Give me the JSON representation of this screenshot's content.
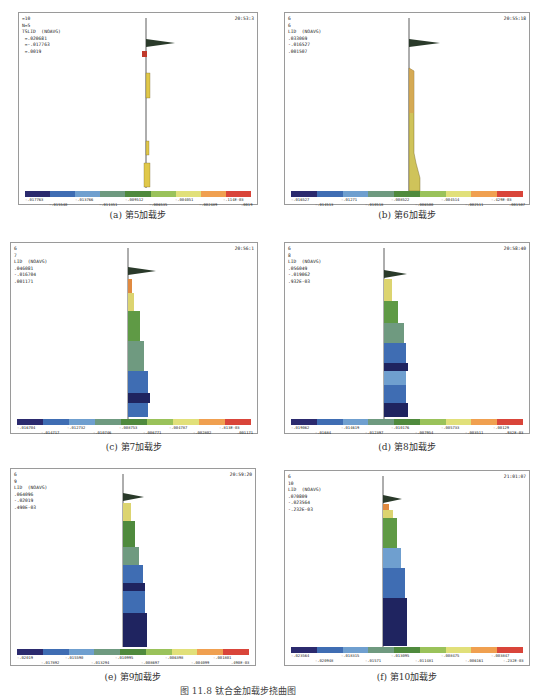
{
  "figure_caption": "图 11.8 钛合金加载步挠曲图",
  "legend_colors": [
    "#2b2a6e",
    "#3f6db3",
    "#6f9fcf",
    "#6f9a80",
    "#4f8a3d",
    "#9ac25a",
    "#e1e07a",
    "#f0a050",
    "#d9453a"
  ],
  "panels": [
    {
      "id": "a",
      "caption": "(a) 第5加载步",
      "info": [
        "=10",
        "N=5",
        "TSLID  (NOAVG)",
        " =.020681",
        " =-.017763",
        " =.0019"
      ],
      "time": "20:53:3",
      "legend_ticks_top": [
        "-.017763",
        "-.013766",
        "-.009512",
        "-.004051",
        "-.114E-03"
      ],
      "legend_ticks_bottom": [
        "-.015540",
        "-.011351",
        "-.006535",
        "-.002489",
        ".0019"
      ]
    },
    {
      "id": "b",
      "caption": "(b) 第6加载步",
      "info": [
        "6",
        "6",
        "LID  (NOAVG)",
        ".033069",
        "-.016527",
        ".001507"
      ],
      "time": "20:55:18",
      "legend_ticks_top": [
        "-.016527",
        "-.01271",
        "-.008522",
        "-.004514",
        "-.429E-03"
      ],
      "legend_ticks_bottom": [
        "-.014513",
        "-.010518",
        "-.006500",
        "-.002511",
        ".001507"
      ]
    },
    {
      "id": "c",
      "caption": "(c) 第7加载步",
      "info": [
        "6",
        "7",
        "LID  (NOAVG)",
        ".046081",
        "-.016704",
        ".001171"
      ],
      "time": "20:56:1",
      "legend_ticks_top": [
        "-.016704",
        "-.012732",
        "-.008753",
        "-.004787",
        "-.813E-03"
      ],
      "legend_ticks_bottom": [
        "-.014717",
        "-.010746",
        "-.006771",
        "-.002802",
        ".001171"
      ]
    },
    {
      "id": "d",
      "caption": "(d) 第8加载步",
      "info": [
        "6",
        "8",
        "LID  (NOAVG)",
        ".056049",
        "-.019062",
        ".932E-03"
      ],
      "time": "20:58:40",
      "legend_ticks_top": [
        "-.019062",
        "-.014619",
        "-.010176",
        "-.005733",
        "-.00129"
      ],
      "legend_ticks_bottom": [
        "-.01684",
        "-.012397",
        "-.007954",
        "-.003511",
        ".932E-03"
      ]
    },
    {
      "id": "e",
      "caption": "(e) 第9加载步",
      "info": [
        "6",
        "9",
        "LID  (NOAVG)",
        ".064096",
        "-.02019",
        ".490E-03"
      ],
      "time": "20:59:20",
      "legend_ticks_top": [
        "-.02019",
        "-.015590",
        "-.010995",
        "-.006398",
        "-.001801"
      ],
      "legend_ticks_bottom": [
        "-.017892",
        "-.013294",
        "-.008697",
        "-.004099",
        ".490E-03"
      ]
    },
    {
      "id": "f",
      "caption": "(f) 第10加载步",
      "info": [
        "6",
        "10",
        "LID  (NOAVG)",
        ".070809",
        "-.023564",
        "-.232E-03"
      ],
      "time": "21:01:07",
      "legend_ticks_top": [
        "-.023564",
        "-.018315",
        "-.013095",
        "-.008475",
        "-.003847"
      ],
      "legend_ticks_bottom": [
        "-.020948",
        "-.01571",
        "-.011481",
        "-.006161",
        "-.232E-03"
      ]
    }
  ]
}
